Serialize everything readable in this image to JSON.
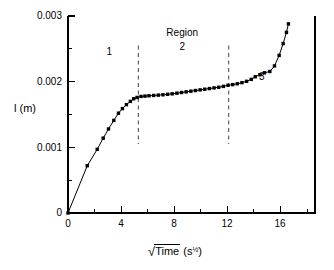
{
  "chart_data": {
    "type": "line",
    "title": "",
    "subtitle": "",
    "xlabel": "√Time (s½)",
    "xlabel_parts": {
      "radical": "√",
      "radicand": "Time",
      "unit_open": "(s",
      "unit_exponent": "½",
      "unit_close": ")"
    },
    "ylabel": "l (m)",
    "xlim": [
      0,
      18.6
    ],
    "ylim": [
      0,
      0.003
    ],
    "xticks": [
      0,
      4,
      8,
      12,
      16
    ],
    "xticklabels": [
      "0",
      "4",
      "8",
      "12",
      "16"
    ],
    "xminorticks": [
      2,
      6,
      10,
      14,
      18
    ],
    "yticks": [
      0,
      0.001,
      0.002,
      0.003
    ],
    "yticklabels": [
      "0",
      "0.001",
      "0.002",
      "0.003"
    ],
    "yminorticks": [
      0.0005,
      0.0015,
      0.0025
    ],
    "grid": false,
    "legend": null,
    "marker": "square",
    "marker_color": "#000000",
    "line_color": "#000000",
    "series": [
      {
        "name": "l vs sqrt(Time)",
        "x": [
          0.0,
          1.45,
          2.2,
          2.65,
          3.05,
          3.45,
          3.8,
          4.1,
          4.4,
          4.7,
          4.95,
          5.2,
          5.5,
          5.8,
          6.1,
          6.45,
          6.8,
          7.15,
          7.5,
          7.85,
          8.2,
          8.55,
          8.9,
          9.25,
          9.6,
          9.95,
          10.3,
          10.65,
          11.0,
          11.35,
          11.7,
          12.05,
          12.4,
          12.75,
          13.1,
          13.45,
          13.8,
          14.1,
          14.45,
          14.8,
          15.2,
          15.55,
          15.9,
          16.2,
          16.45,
          16.6
        ],
        "y": [
          0.0,
          0.00072,
          0.00097,
          0.00114,
          0.00128,
          0.00141,
          0.00152,
          0.00159,
          0.00165,
          0.0017,
          0.00174,
          0.00176,
          0.001775,
          0.00178,
          0.001785,
          0.00179,
          0.001795,
          0.0018,
          0.001808,
          0.001815,
          0.001825,
          0.001835,
          0.001845,
          0.001855,
          0.001865,
          0.001875,
          0.001885,
          0.001895,
          0.001905,
          0.001915,
          0.001928,
          0.001945,
          0.001955,
          0.001968,
          0.001985,
          0.002005,
          0.002035,
          0.002075,
          0.002105,
          0.002135,
          0.002155,
          0.00224,
          0.0024,
          0.00258,
          0.00275,
          0.00288
        ]
      }
    ],
    "annotations": [
      {
        "id": "region-word",
        "text": "Region",
        "x": 8.6,
        "y": 0.00272
      },
      {
        "id": "region-1",
        "text": "1",
        "x": 3.1,
        "y": 0.00243
      },
      {
        "id": "region-2",
        "text": "2",
        "x": 8.6,
        "y": 0.00252
      },
      {
        "id": "region-3",
        "text": "3",
        "x": 14.6,
        "y": 0.00206
      }
    ],
    "vlines": [
      {
        "id": "divider-region-1-2",
        "x": 5.3,
        "ymin": 0.00105,
        "ymax": 0.00255,
        "style": "dashed"
      },
      {
        "id": "divider-region-2-3",
        "x": 12.1,
        "ymin": 0.00105,
        "ymax": 0.00255,
        "style": "dashed"
      }
    ]
  },
  "axes": {
    "y_title": "l (m)",
    "x_title_radical": "√",
    "x_title_radicand": "Time",
    "x_title_unit_open": "(s",
    "x_title_unit_exp": "½",
    "x_title_unit_close": ")"
  },
  "colors": {
    "background": "#ffffff",
    "foreground": "#000000",
    "dashed": "#555555"
  }
}
